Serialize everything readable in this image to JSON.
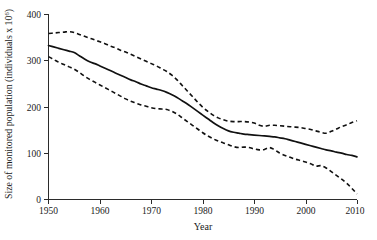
{
  "chart_data": {
    "type": "line",
    "title": "",
    "xlabel": "Year",
    "ylabel": "Size of monitored population (individuals x 10",
    "ylabel_exponent": "6",
    "ylabel_close": ")",
    "xlim": [
      1950,
      2010
    ],
    "ylim": [
      0,
      400
    ],
    "xticks": [
      1950,
      1960,
      1970,
      1980,
      1990,
      2000,
      2010
    ],
    "yticks": [
      0,
      100,
      200,
      300,
      400
    ],
    "xtick_labels": [
      "1950",
      "1960",
      "1970",
      "1980",
      "1990",
      "2000",
      "2010"
    ],
    "ytick_labels": [
      "0",
      "100",
      "200",
      "300",
      "400"
    ],
    "grid": false,
    "legend": "none",
    "x": [
      1950,
      1951,
      1952,
      1953,
      1954,
      1955,
      1956,
      1957,
      1958,
      1959,
      1960,
      1961,
      1962,
      1963,
      1964,
      1965,
      1966,
      1967,
      1968,
      1969,
      1970,
      1971,
      1972,
      1973,
      1974,
      1975,
      1976,
      1977,
      1978,
      1979,
      1980,
      1981,
      1982,
      1983,
      1984,
      1985,
      1986,
      1987,
      1988,
      1989,
      1990,
      1991,
      1992,
      1993,
      1994,
      1995,
      1996,
      1997,
      1998,
      1999,
      2000,
      2001,
      2002,
      2003,
      2004,
      2005,
      2006,
      2007,
      2008,
      2009,
      2010
    ],
    "series": [
      {
        "name": "Upper confidence bound",
        "style": "dashed",
        "values": [
          358,
          359,
          360,
          361,
          362,
          360,
          356,
          352,
          348,
          344,
          340,
          336,
          331,
          327,
          322,
          318,
          313,
          308,
          303,
          298,
          293,
          288,
          282,
          276,
          268,
          258,
          246,
          234,
          222,
          210,
          199,
          190,
          182,
          176,
          172,
          169,
          168,
          168,
          168,
          167,
          165,
          160,
          158,
          160,
          160,
          159,
          158,
          157,
          156,
          155,
          153,
          151,
          148,
          145,
          143,
          147,
          152,
          157,
          161,
          166,
          170
        ]
      },
      {
        "name": "Mean monitored population size",
        "style": "solid",
        "values": [
          332,
          329,
          326,
          323,
          320,
          317,
          310,
          303,
          297,
          293,
          288,
          283,
          278,
          273,
          268,
          263,
          258,
          254,
          249,
          245,
          241,
          238,
          235,
          231,
          226,
          220,
          213,
          206,
          198,
          190,
          182,
          174,
          166,
          159,
          153,
          148,
          145,
          143,
          141,
          140,
          139,
          138,
          137,
          136,
          135,
          133,
          131,
          128,
          125,
          122,
          119,
          116,
          113,
          110,
          107,
          105,
          102,
          100,
          97,
          95,
          92
        ]
      },
      {
        "name": "Lower confidence bound",
        "style": "dashed",
        "values": [
          308,
          302,
          296,
          291,
          286,
          281,
          274,
          266,
          259,
          253,
          247,
          241,
          235,
          229,
          223,
          217,
          212,
          208,
          204,
          201,
          198,
          196,
          195,
          194,
          190,
          184,
          176,
          168,
          160,
          152,
          144,
          137,
          131,
          126,
          122,
          118,
          114,
          112,
          113,
          112,
          109,
          107,
          108,
          112,
          107,
          100,
          95,
          91,
          87,
          84,
          81,
          77,
          72,
          73,
          68,
          60,
          52,
          44,
          35,
          24,
          12
        ]
      }
    ]
  }
}
